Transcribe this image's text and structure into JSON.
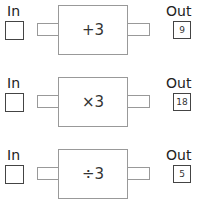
{
  "labels": {
    "in": "In",
    "out": "Out"
  },
  "machines": [
    {
      "operation": "+3",
      "input": "",
      "output": "9"
    },
    {
      "operation": "×3",
      "input": "",
      "output": "18"
    },
    {
      "operation": "÷3",
      "input": "",
      "output": "5"
    }
  ]
}
